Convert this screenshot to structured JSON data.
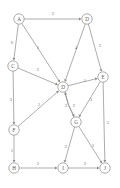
{
  "figure": {
    "type": "weighted-directed-graph",
    "background_color": "#ffffff",
    "stroke_color": "#8a8a8a",
    "label_color": "#5a5a5a",
    "weight_color": "#6b6b6b",
    "node_radius": 5.2
  },
  "nodes": [
    {
      "id": "A",
      "label": "A",
      "x": 19,
      "y": 19
    },
    {
      "id": "B",
      "label": "D",
      "x": 87,
      "y": 19
    },
    {
      "id": "C",
      "label": "C",
      "x": 13,
      "y": 66
    },
    {
      "id": "D",
      "label": "D",
      "x": 63,
      "y": 87
    },
    {
      "id": "E",
      "label": "E",
      "x": 103,
      "y": 77
    },
    {
      "id": "F",
      "label": "F",
      "x": 14,
      "y": 130
    },
    {
      "id": "G",
      "label": "G",
      "x": 76,
      "y": 122
    },
    {
      "id": "H",
      "label": "H",
      "x": 14,
      "y": 168
    },
    {
      "id": "I",
      "label": "I",
      "x": 63,
      "y": 168
    },
    {
      "id": "J",
      "label": "J",
      "x": 105,
      "y": 168
    }
  ],
  "edges": [
    {
      "from": "A",
      "to": "B",
      "weight": "2",
      "label_x": 53,
      "label_y": 13
    },
    {
      "from": "A",
      "to": "C",
      "weight": "6",
      "label_x": 12,
      "label_y": 42
    },
    {
      "from": "A",
      "to": "D",
      "weight": "1",
      "label_x": 38,
      "label_y": 47
    },
    {
      "from": "B",
      "to": "D",
      "weight": "4",
      "label_x": 76,
      "label_y": 47
    },
    {
      "from": "B",
      "to": "E",
      "weight": "3",
      "label_x": 100,
      "label_y": 45
    },
    {
      "from": "C",
      "to": "D",
      "weight": "2",
      "label_x": 38,
      "label_y": 69
    },
    {
      "from": "C",
      "to": "F",
      "weight": "3",
      "label_x": 11,
      "label_y": 99
    },
    {
      "from": "D",
      "to": "E",
      "weight": "1",
      "label_x": 85,
      "label_y": 80
    },
    {
      "from": "F",
      "to": "D",
      "weight": "1",
      "label_x": 39,
      "label_y": 104
    },
    {
      "from": "D",
      "to": "G",
      "weight": "3",
      "label_x": 66,
      "label_y": 105
    },
    {
      "from": "G",
      "to": "D",
      "weight": "2",
      "label_x": 74,
      "label_y": 105
    },
    {
      "from": "E",
      "to": "G",
      "weight": "3",
      "label_x": 91,
      "label_y": 99
    },
    {
      "from": "E",
      "to": "J",
      "weight": "5",
      "label_x": 108,
      "label_y": 122
    },
    {
      "from": "F",
      "to": "H",
      "weight": "1",
      "label_x": 12,
      "label_y": 150
    },
    {
      "from": "G",
      "to": "I",
      "weight": "2",
      "label_x": 66,
      "label_y": 146
    },
    {
      "from": "G",
      "to": "J",
      "weight": "3",
      "label_x": 93,
      "label_y": 145
    },
    {
      "from": "H",
      "to": "I",
      "weight": "2",
      "label_x": 38,
      "label_y": 163
    },
    {
      "from": "I",
      "to": "J",
      "weight": "3",
      "label_x": 85,
      "label_y": 163
    }
  ]
}
